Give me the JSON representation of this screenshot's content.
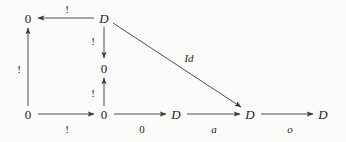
{
  "diagram": {
    "background_color": "#fbfbf9",
    "stroke_color": "#3a3a3a",
    "text_color": "#1b1b1b",
    "width": 346,
    "height": 142,
    "nodes": [
      {
        "id": "n-top-left",
        "label": "0",
        "style": "upright",
        "x": 28,
        "y": 18
      },
      {
        "id": "n-top-mid",
        "label": "D",
        "style": "italic",
        "x": 104,
        "y": 18
      },
      {
        "id": "n-center-mid",
        "label": "0",
        "style": "upright",
        "x": 104,
        "y": 68
      },
      {
        "id": "n-bottom-left",
        "label": "0",
        "style": "upright",
        "x": 28,
        "y": 114
      },
      {
        "id": "n-bottom-mid",
        "label": "0",
        "style": "upright",
        "x": 104,
        "y": 114
      },
      {
        "id": "n-bottom-d1",
        "label": "D",
        "style": "italic",
        "x": 176,
        "y": 114
      },
      {
        "id": "n-bottom-d2",
        "label": "D",
        "style": "italic",
        "x": 250,
        "y": 114
      },
      {
        "id": "n-bottom-d3",
        "label": "D",
        "style": "italic",
        "x": 323,
        "y": 114
      }
    ],
    "edges": [
      {
        "id": "edge-top-d-to-zero",
        "from": "n-top-mid",
        "to": "n-top-left",
        "label": "!",
        "label_style": "bang",
        "label_x": 67,
        "label_y": 9,
        "x1": 94,
        "y1": 18,
        "x2": 38,
        "y2": 18
      },
      {
        "id": "edge-bottomleft-up-to-topleft",
        "from": "n-bottom-left",
        "to": "n-top-left",
        "label": "!",
        "label_style": "bang",
        "label_x": 19,
        "label_y": 69,
        "x1": 28,
        "y1": 106,
        "x2": 28,
        "y2": 28
      },
      {
        "id": "edge-topmid-down-to-centermid",
        "from": "n-top-mid",
        "to": "n-center-mid",
        "label": "!",
        "label_style": "bang",
        "label_x": 93,
        "label_y": 41,
        "x1": 104,
        "y1": 27,
        "x2": 104,
        "y2": 58
      },
      {
        "id": "edge-bottommid-up-to-centermid",
        "from": "n-bottom-mid",
        "to": "n-center-mid",
        "label": "!",
        "label_style": "bang",
        "label_x": 93,
        "label_y": 93,
        "x1": 104,
        "y1": 106,
        "x2": 104,
        "y2": 78
      },
      {
        "id": "edge-topmid-diagonal-to-d2",
        "from": "n-top-mid",
        "to": "n-bottom-d2",
        "label": "Id",
        "label_style": "italic",
        "label_x": 189,
        "label_y": 58,
        "x1": 113,
        "y1": 23,
        "x2": 241,
        "y2": 107
      },
      {
        "id": "edge-bottomleft-to-bottommid",
        "from": "n-bottom-left",
        "to": "n-bottom-mid",
        "label": "!",
        "label_style": "bang",
        "label_x": 67,
        "label_y": 129,
        "x1": 38,
        "y1": 114,
        "x2": 94,
        "y2": 114
      },
      {
        "id": "edge-bottommid-to-d1",
        "from": "n-bottom-mid",
        "to": "n-bottom-d1",
        "label": "0",
        "label_style": "upright",
        "label_x": 142,
        "label_y": 129,
        "x1": 114,
        "y1": 114,
        "x2": 166,
        "y2": 114
      },
      {
        "id": "edge-d1-to-d2",
        "from": "n-bottom-d1",
        "to": "n-bottom-d2",
        "label": "a",
        "label_style": "italic",
        "label_x": 214,
        "label_y": 129,
        "x1": 187,
        "y1": 114,
        "x2": 240,
        "y2": 114
      },
      {
        "id": "edge-d2-to-d3",
        "from": "n-bottom-d2",
        "to": "n-bottom-d3",
        "label": "o",
        "label_style": "italic",
        "label_x": 290,
        "label_y": 129,
        "x1": 261,
        "y1": 114,
        "x2": 313,
        "y2": 114
      }
    ]
  }
}
